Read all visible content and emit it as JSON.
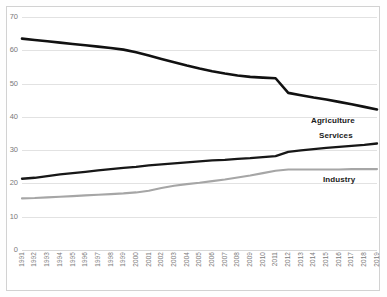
{
  "chart_data": {
    "type": "line",
    "title": "",
    "xlabel": "",
    "ylabel": "",
    "ylim": [
      0,
      70
    ],
    "ytick_values": [
      0,
      10,
      20,
      30,
      40,
      50,
      60,
      70
    ],
    "grid": true,
    "legend_position": "inline-right",
    "x": [
      "1991",
      "1992",
      "1993",
      "1994",
      "1995",
      "1996",
      "1997",
      "1998",
      "1999",
      "2000",
      "2001",
      "2002",
      "2003",
      "2004",
      "2005",
      "2006",
      "2007",
      "2008",
      "2009",
      "2010",
      "2011",
      "2012",
      "2013",
      "2014",
      "2015",
      "2016",
      "2017",
      "2018",
      "2019"
    ],
    "series": [
      {
        "name": "Agriculture",
        "color": "#111111",
        "width": 2.6,
        "values": [
          63.5,
          63.1,
          62.7,
          62.3,
          61.9,
          61.5,
          61.1,
          60.7,
          60.2,
          59.4,
          58.4,
          57.4,
          56.4,
          55.4,
          54.5,
          53.7,
          53.0,
          52.4,
          52.0,
          51.8,
          51.6,
          47.2,
          46.5,
          45.8,
          45.2,
          44.5,
          43.8,
          43.0,
          42.2
        ]
      },
      {
        "name": "Services",
        "color": "#171717",
        "width": 2.3,
        "values": [
          21.4,
          21.7,
          22.2,
          22.7,
          23.1,
          23.5,
          23.9,
          24.3,
          24.7,
          25.0,
          25.4,
          25.7,
          26.0,
          26.3,
          26.6,
          26.9,
          27.1,
          27.4,
          27.6,
          27.9,
          28.2,
          29.5,
          29.9,
          30.3,
          30.7,
          31.0,
          31.3,
          31.6,
          32.0
        ]
      },
      {
        "name": "Industry",
        "color": "#a6a6a6",
        "width": 2.1,
        "values": [
          15.5,
          15.6,
          15.8,
          16.0,
          16.2,
          16.4,
          16.6,
          16.8,
          17.0,
          17.3,
          17.8,
          18.6,
          19.3,
          19.8,
          20.2,
          20.7,
          21.2,
          21.8,
          22.4,
          23.1,
          23.8,
          24.2,
          24.2,
          24.2,
          24.2,
          24.2,
          24.3,
          24.3,
          24.3
        ]
      }
    ],
    "annotations": [
      {
        "text": "Agriculture",
        "series": "Agriculture"
      },
      {
        "text": "Services",
        "series": "Services"
      },
      {
        "text": "Industry",
        "series": "Industry"
      }
    ]
  }
}
